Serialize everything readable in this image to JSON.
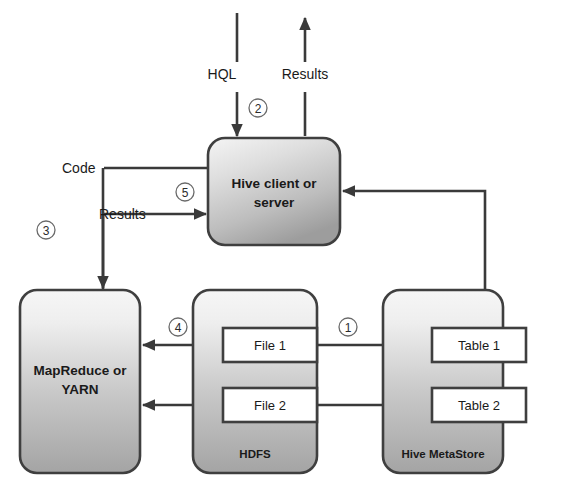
{
  "diagram": {
    "colors": {
      "stroke": "#3f3f3f",
      "connector": "#3a3a3a",
      "box_gradient_top": "#f4f4f4",
      "box_gradient_bottom": "#a6a6a6",
      "inner_box_fill": "#ffffff",
      "text": "#1a1a1a",
      "circle_stroke": "#6a6a6a"
    },
    "boxes": [
      {
        "id": "hive-client",
        "label_line1": "Hive client or",
        "label_line2": "server",
        "x": 208,
        "y": 138,
        "w": 132,
        "h": 107
      },
      {
        "id": "mapreduce",
        "label_line1": "MapReduce or",
        "label_line2": "YARN",
        "x": 20,
        "y": 290,
        "w": 120,
        "h": 183
      },
      {
        "id": "hdfs",
        "label_line1": "HDFS",
        "label_line2": "",
        "x": 193,
        "y": 290,
        "w": 124,
        "h": 183
      },
      {
        "id": "metastore",
        "label_line1": "Hive MetaStore",
        "label_line2": "",
        "x": 383,
        "y": 290,
        "w": 120,
        "h": 183
      }
    ],
    "inner_boxes": [
      {
        "id": "file-1",
        "label": "File 1",
        "x": 223,
        "y": 328,
        "w": 94,
        "h": 34
      },
      {
        "id": "file-2",
        "label": "File 2",
        "x": 223,
        "y": 388,
        "w": 94,
        "h": 34
      },
      {
        "id": "table-1",
        "label": "Table 1",
        "x": 432,
        "y": 328,
        "w": 94,
        "h": 34
      },
      {
        "id": "table-2",
        "label": "Table 2",
        "x": 432,
        "y": 388,
        "w": 94,
        "h": 34
      }
    ],
    "flow_labels": [
      {
        "id": "hql-label",
        "text": "HQL",
        "x": 222,
        "y": 79,
        "anchor": "middle"
      },
      {
        "id": "results-top",
        "text": "Results",
        "x": 305,
        "y": 79,
        "anchor": "middle"
      },
      {
        "id": "code-label",
        "text": "Code",
        "x": 62,
        "y": 173,
        "anchor": "start"
      },
      {
        "id": "results-left",
        "text": "Results",
        "x": 99,
        "y": 218,
        "anchor": "start"
      }
    ],
    "step_numbers": [
      {
        "id": "step-1",
        "text": "1",
        "cx": 348,
        "cy": 327,
        "r": 9
      },
      {
        "id": "step-2",
        "text": "2",
        "cx": 258,
        "cy": 108,
        "r": 9
      },
      {
        "id": "step-3",
        "text": "3",
        "cx": 46,
        "cy": 230,
        "r": 9
      },
      {
        "id": "step-4",
        "text": "4",
        "cx": 178,
        "cy": 327,
        "r": 9
      },
      {
        "id": "step-5",
        "text": "5",
        "cx": 185,
        "cy": 192,
        "r": 9
      }
    ],
    "connectors": [
      {
        "id": "hql-arrow",
        "from": "external-top",
        "to": "hive-client",
        "step": "2"
      },
      {
        "id": "results-out-arrow",
        "from": "hive-client",
        "to": "external-top"
      },
      {
        "id": "code-arrow",
        "from": "hive-client",
        "to": "mapreduce",
        "step": "3"
      },
      {
        "id": "results-in-arrow",
        "from": "mapreduce",
        "to": "hive-client",
        "step": "5"
      },
      {
        "id": "metastore-to-client",
        "from": "metastore",
        "to": "hive-client"
      },
      {
        "id": "file1-to-table1",
        "from": "file-1",
        "to": "table-1",
        "step": "1"
      },
      {
        "id": "file2-to-table2",
        "from": "file-2",
        "to": "table-2"
      },
      {
        "id": "file1-to-mapreduce",
        "from": "file-1",
        "to": "mapreduce",
        "step": "4"
      },
      {
        "id": "file2-to-mapreduce",
        "from": "file-2",
        "to": "mapreduce"
      }
    ]
  }
}
